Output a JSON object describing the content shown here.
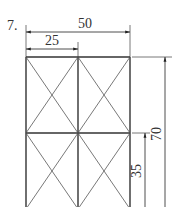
{
  "problem": {
    "number_label": "7.",
    "dimensions": {
      "total_width": "50",
      "half_width": "25",
      "total_height": "70",
      "half_height": "35"
    }
  },
  "figure": {
    "type": "rectangle frame with cross-braced panels",
    "columns": 2,
    "rows": 2,
    "line_color": "#333333",
    "background": "#ffffff"
  }
}
